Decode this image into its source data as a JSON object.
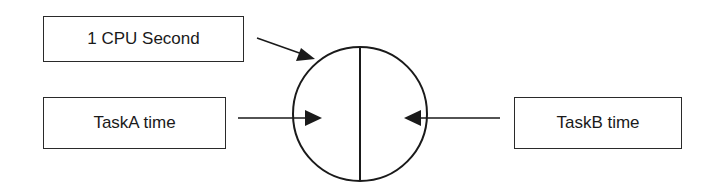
{
  "diagram": {
    "nodes": {
      "cpu_second": {
        "label": "1 CPU Second"
      },
      "task_a": {
        "label": "TaskA time"
      },
      "task_b": {
        "label": "TaskB time"
      },
      "cpu_circle": {
        "label": "",
        "divided": "vertical split into two halves"
      }
    },
    "edges": [
      {
        "from": "cpu_second",
        "to": "cpu_circle"
      },
      {
        "from": "task_a",
        "to": "cpu_circle left half"
      },
      {
        "from": "task_b",
        "to": "cpu_circle right half"
      }
    ],
    "colors": {
      "stroke": "#1a1a1a",
      "background": "#ffffff"
    }
  }
}
